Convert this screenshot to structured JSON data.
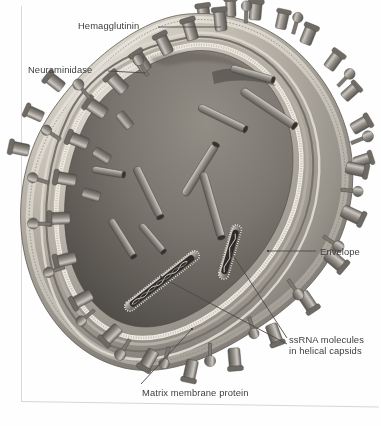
{
  "figure": {
    "rendering": "grayscale-3d-illustration",
    "colors": {
      "background": "#fefefe",
      "label_text": "#3d3d3d",
      "leader_line": "#4a4a4a",
      "envelope_outer_light": "#e7e3da",
      "envelope_mid": "#b9b3a8",
      "membrane_dark": "#6e6a64",
      "matrix_layer": "#9a958c",
      "interior_cavity": "#7d7871",
      "interior_shadow": "#5a5650",
      "spike_body": "#7a7670",
      "spike_highlight": "#cfcbc4",
      "capsid_rod": "#8e8a83",
      "capsid_rod_dark": "#3c3a37",
      "page_border": "#d8d8d8"
    },
    "structures": [
      {
        "name": "hemagglutinin",
        "shape": "ribbed-cylinder-spike",
        "count": 34,
        "location": "envelope-surface"
      },
      {
        "name": "neuraminidase",
        "shape": "mushroom-stalk-spike",
        "count": 18,
        "location": "envelope-surface"
      },
      {
        "name": "envelope",
        "shape": "lipid-bilayer-shell",
        "location": "virion-perimeter"
      },
      {
        "name": "matrix-membrane-protein",
        "shape": "beaded-inner-layer",
        "location": "beneath-envelope"
      },
      {
        "name": "ssrna-helical-capsid",
        "shape": "ribbed-rod",
        "count": 12,
        "location": "virion-interior"
      }
    ]
  },
  "labels": {
    "hemagglutinin": "Hemagglutinin",
    "neuraminidase": "Neuraminidase",
    "envelope": "Envelope",
    "ssrna_line1": "ssRNA molecules",
    "ssrna_line2": "in helical capsids",
    "matrix": "Matrix membrane protein"
  },
  "leaders": [
    {
      "for": "hemagglutinin",
      "from": [
        158,
        27
      ],
      "to": [
        221,
        27
      ]
    },
    {
      "for": "neuraminidase",
      "from": [
        108,
        71
      ],
      "to": [
        146,
        73
      ]
    },
    {
      "for": "envelope",
      "from": [
        268,
        251
      ],
      "to": [
        316,
        251
      ]
    },
    {
      "for": "ssrna_upper",
      "from": [
        231,
        252
      ],
      "to": [
        287,
        338
      ]
    },
    {
      "for": "ssrna_lower",
      "from": [
        161,
        277
      ],
      "to": [
        287,
        344
      ]
    },
    {
      "for": "matrix",
      "from": [
        192,
        329
      ],
      "to": [
        140,
        385
      ]
    }
  ]
}
